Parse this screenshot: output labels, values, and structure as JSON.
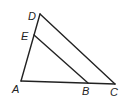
{
  "diagram": {
    "type": "geometry-triangle",
    "points": {
      "A": {
        "x": 21,
        "y": 81
      },
      "B": {
        "x": 88,
        "y": 83
      },
      "C": {
        "x": 115,
        "y": 84
      },
      "D": {
        "x": 40,
        "y": 14
      },
      "E": {
        "x": 34,
        "y": 35
      }
    },
    "segments": [
      [
        "A",
        "C"
      ],
      [
        "A",
        "D"
      ],
      [
        "D",
        "C"
      ],
      [
        "E",
        "B"
      ]
    ],
    "labels": {
      "A": "A",
      "B": "B",
      "C": "C",
      "D": "D",
      "E": "E"
    },
    "colors": {
      "stroke": "#222222",
      "background": "#ffffff"
    }
  }
}
